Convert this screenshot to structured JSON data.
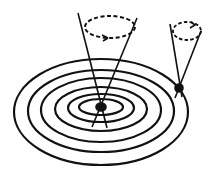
{
  "diagram": {
    "colors": {
      "background": "#ffffff",
      "ink": "#111111"
    },
    "contours": [
      {
        "cx": 101,
        "cy": 112,
        "rx": 87,
        "ry": 53
      },
      {
        "cx": 101,
        "cy": 111,
        "rx": 73,
        "ry": 41
      },
      {
        "cx": 101,
        "cy": 110,
        "rx": 60,
        "ry": 32
      },
      {
        "cx": 101,
        "cy": 109,
        "rx": 46,
        "ry": 22
      },
      {
        "cx": 101,
        "cy": 108,
        "rx": 33,
        "ry": 14
      },
      {
        "cx": 101,
        "cy": 107,
        "rx": 22,
        "ry": 8
      }
    ],
    "central_cone": {
      "apex": {
        "x": 101,
        "y": 107
      },
      "top_left": {
        "x": 78,
        "y": 13
      },
      "top_right": {
        "x": 137,
        "y": 18
      },
      "bottom_left": {
        "x": 92,
        "y": 127
      },
      "bottom_right": {
        "x": 107,
        "y": 128
      },
      "dashed_circle": {
        "cx": 110,
        "cy": 27,
        "rx": 25,
        "ry": 11
      },
      "arrow": "counterclockwise arrowhead on lower front of dashed circle"
    },
    "rim_cone": {
      "apex": {
        "x": 179,
        "y": 88
      },
      "top_left": {
        "x": 170,
        "y": 24
      },
      "top_right": {
        "x": 201,
        "y": 31
      },
      "bottom_left": {
        "x": 175,
        "y": 98
      },
      "bottom_right": {
        "x": 182,
        "y": 97
      },
      "dashed_circle": {
        "cx": 187,
        "cy": 31,
        "rx": 14,
        "ry": 9
      },
      "arrow": "arrowhead on top of dashed circle"
    }
  }
}
